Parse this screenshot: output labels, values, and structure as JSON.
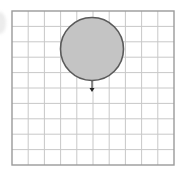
{
  "figure": {
    "grid": {
      "columns": 10,
      "rows": 10,
      "x": 12,
      "y": 11,
      "width": 162,
      "height": 154,
      "line_color": "#c8c8c8",
      "border_color": "#9a9a9a"
    },
    "circle": {
      "cx": 92,
      "cy": 49,
      "r": 31.5,
      "fill": "#c4c4c4",
      "stroke": "#5a5a5a"
    },
    "arrow": {
      "x": 92,
      "y1": 81,
      "y2": 92,
      "direction": "down",
      "color": "#222222"
    }
  }
}
